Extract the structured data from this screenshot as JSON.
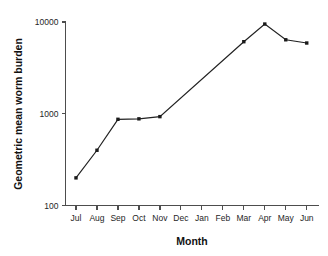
{
  "chart_data": {
    "type": "line",
    "title": "",
    "xlabel": "Month",
    "ylabel": "Geometric mean worm burden",
    "yscale": "log",
    "ylim": [
      100,
      10000
    ],
    "grid": false,
    "legend": false,
    "categories": [
      "Jul",
      "Aug",
      "Sep",
      "Oct",
      "Nov",
      "Dec",
      "Jan",
      "Feb",
      "Mar",
      "Apr",
      "May",
      "Jun"
    ],
    "ytick_labels": [
      "100",
      "1000",
      "10000"
    ],
    "ytick_values": [
      100,
      1000,
      10000
    ],
    "series": [
      {
        "name": "Geometric mean worm burden",
        "marker": "filled-square",
        "color": "#1a1a1a",
        "values": [
          200,
          400,
          870,
          880,
          930,
          null,
          null,
          null,
          6100,
          9500,
          6400,
          5900
        ]
      }
    ],
    "points": [
      {
        "x": "Jul",
        "y": 200
      },
      {
        "x": "Aug",
        "y": 400
      },
      {
        "x": "Sep",
        "y": 870
      },
      {
        "x": "Oct",
        "y": 880
      },
      {
        "x": "Nov",
        "y": 930
      },
      {
        "x": "Mar",
        "y": 6100
      },
      {
        "x": "Apr",
        "y": 9500
      },
      {
        "x": "May",
        "y": 6400
      },
      {
        "x": "Jun",
        "y": 5900
      }
    ],
    "annotations": []
  },
  "axes": {
    "x_title": "Month",
    "y_title": "Geometric mean worm burden"
  }
}
